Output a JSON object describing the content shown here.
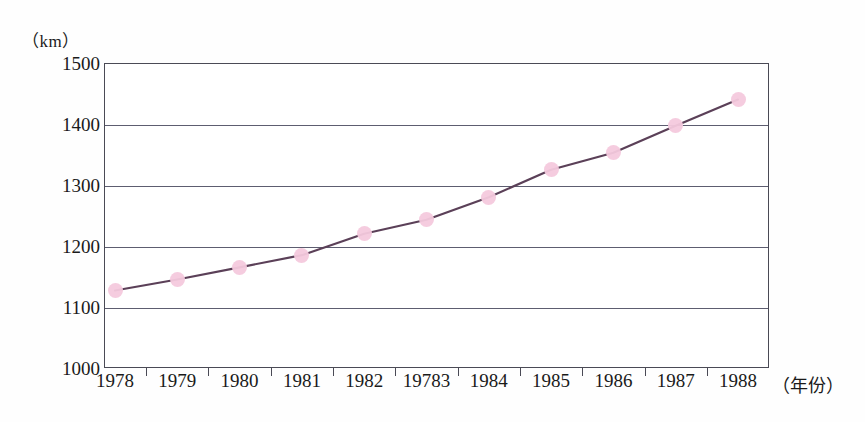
{
  "chart_data": {
    "type": "line",
    "title": "",
    "subtitle": "",
    "xlabel": "（年份）",
    "ylabel": "（km）",
    "categories": [
      "1978",
      "1979",
      "1980",
      "1981",
      "1982",
      "19783",
      "1984",
      "1985",
      "1986",
      "1987",
      "1988"
    ],
    "values": [
      1127,
      1145,
      1165,
      1185,
      1220,
      1243,
      1280,
      1325,
      1353,
      1397,
      1440
    ],
    "series": [
      {
        "name": "length",
        "values": [
          1127,
          1145,
          1165,
          1185,
          1220,
          1243,
          1280,
          1325,
          1353,
          1397,
          1440
        ]
      }
    ],
    "ylim": [
      1000,
      1500
    ],
    "yticks": [
      "1000",
      "1100",
      "1200",
      "1300",
      "1400",
      "1500"
    ],
    "ytick_values": [
      1000,
      1100,
      1200,
      1300,
      1400,
      1500
    ],
    "grid": "horizontal",
    "legend": "none",
    "marker_color": "#f4c9dd",
    "line_color": "#5b4058",
    "axis_color": "#4a4a55",
    "gridline_color": "#5d5d70"
  },
  "axes": {
    "y_unit_label": "（km）",
    "x_unit_label": "（年份）"
  }
}
